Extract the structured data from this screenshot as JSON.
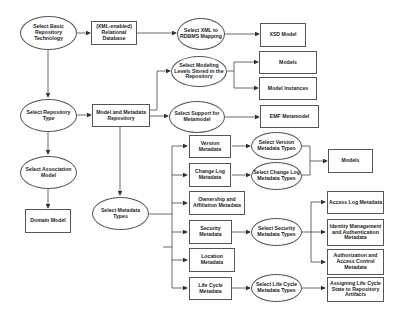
{
  "diagram": {
    "nodes": {
      "select_basic_repo_tech": "Select Basic Repository Technology",
      "relational_db": "(XML-enabled) Relational Database",
      "select_xml_rdbms": "Select XML to RDBMS Mapping",
      "xsd_model": "XSD Model",
      "select_modeling_levels": "Select Modeling Levels Stored in the Repository",
      "models_top": "Models",
      "model_instances": "Model Instances",
      "select_repo_type": "Select Repository Type",
      "model_metadata_repo": "Model and Metadata Repository",
      "select_support_metamodel": "Select Support for Metamodel",
      "emf_metamodel": "EMF Metamodel",
      "select_association_model": "Select Association Model",
      "domain_model": "Domain Model",
      "select_metadata_types": "Select Metadata Types",
      "version_metadata": "Version Metadata",
      "change_log_metadata": "Change Log Metadata",
      "ownership_metadata": "Ownership and Affiliation Metadata",
      "security_metadata": "Security Metadata",
      "location_metadata": "Location Metadata",
      "life_cycle_metadata": "Life Cycle Metadata",
      "select_version_types": "Select Version Metadata Types",
      "select_change_log_types": "Select Change Log Metadata Types",
      "models_right": "Models",
      "select_security_types": "Select Security Metadata Types",
      "access_log_metadata": "Access Log Metadata",
      "identity_mgmt_metadata": "Identity Management and Authentication Metadata",
      "authorization_metadata": "Authorization and Access Control Metadata",
      "select_life_cycle_types": "Select Life Cycle Metadata Types",
      "assigning_life_cycle": "Assigning Life Cycle State to Repository Artifacts"
    }
  }
}
